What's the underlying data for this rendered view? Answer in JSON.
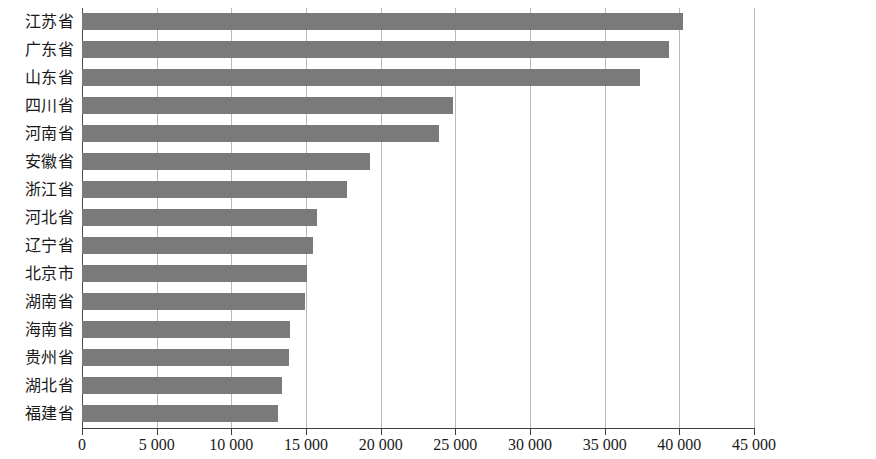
{
  "chart_data": {
    "type": "bar",
    "orientation": "horizontal",
    "title": "",
    "xlabel": "",
    "ylabel": "",
    "xlim": [
      0,
      45000
    ],
    "xticks": [
      0,
      5000,
      10000,
      15000,
      20000,
      25000,
      30000,
      35000,
      40000,
      45000
    ],
    "xtick_labels": [
      "0",
      "5 000",
      "10 000",
      "15 000",
      "20 000",
      "25 000",
      "30 000",
      "35 000",
      "40 000",
      "45 000"
    ],
    "thousands_separator": " ",
    "grid": "vertical",
    "legend": "none",
    "bar_color": "#7a7a7a",
    "categories": [
      "江苏省",
      "广东省",
      "山东省",
      "四川省",
      "河南省",
      "安徽省",
      "浙江省",
      "河北省",
      "辽宁省",
      "北京市",
      "湖南省",
      "海南省",
      "贵州省",
      "湖北省",
      "福建省"
    ],
    "values": [
      40250,
      39300,
      37350,
      24850,
      23900,
      19300,
      17750,
      15750,
      15450,
      15100,
      14950,
      13900,
      13850,
      13400,
      13150
    ],
    "series": [
      {
        "name": "",
        "values": [
          40250,
          39300,
          37350,
          24850,
          23900,
          19300,
          17750,
          15750,
          15450,
          15100,
          14950,
          13900,
          13850,
          13400,
          13150
        ]
      }
    ]
  }
}
